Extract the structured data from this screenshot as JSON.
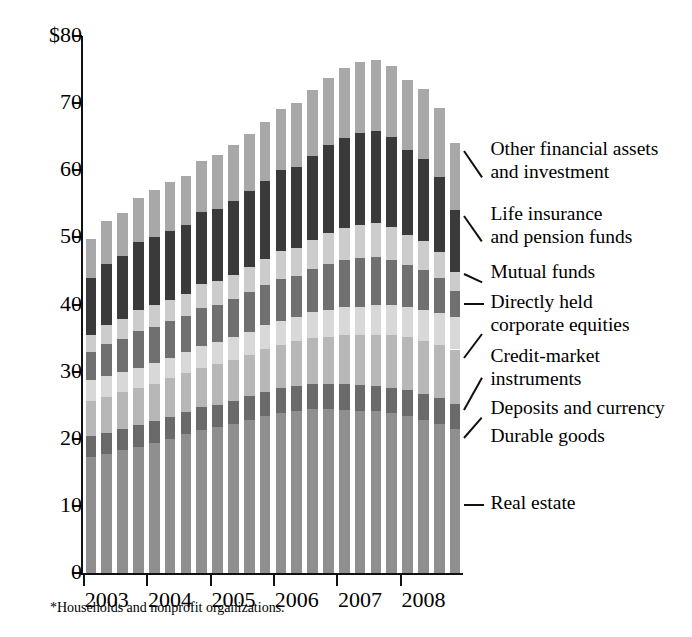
{
  "chart_data": {
    "type": "bar",
    "subtype": "stacked-vertical",
    "title": "",
    "xlabel": "",
    "ylabel": "",
    "ylim": [
      0,
      80
    ],
    "yticks": [
      0,
      10,
      20,
      30,
      40,
      50,
      60,
      70,
      80
    ],
    "ytick_labels": [
      "0",
      "10",
      "20",
      "30",
      "40",
      "50",
      "60",
      "70",
      "$80"
    ],
    "units": "trillions of dollars",
    "grid": false,
    "legend_position": "right-callouts",
    "xticks": [
      2003,
      2004,
      2005,
      2006,
      2007,
      2008
    ],
    "xtick_labels": [
      "2003",
      "2004",
      "2005",
      "2006",
      "2007",
      "2008"
    ],
    "x": [
      "2003Q1",
      "2003Q2",
      "2003Q3",
      "2003Q4",
      "2004Q1",
      "2004Q2",
      "2004Q3",
      "2004Q4",
      "2005Q1",
      "2005Q2",
      "2005Q3",
      "2005Q4",
      "2006Q1",
      "2006Q2",
      "2006Q3",
      "2006Q4",
      "2007Q1",
      "2007Q2",
      "2007Q3",
      "2007Q4",
      "2008Q1",
      "2008Q2",
      "2008Q3",
      "2008Q4"
    ],
    "series": [
      {
        "name": "Real estate",
        "color": "#8f8f8f",
        "values": [
          17.3,
          17.8,
          18.3,
          18.8,
          19.4,
          20.0,
          20.7,
          21.3,
          21.7,
          22.2,
          22.8,
          23.4,
          23.9,
          24.2,
          24.4,
          24.4,
          24.3,
          24.2,
          24.1,
          23.8,
          23.4,
          22.8,
          22.2,
          21.5
        ]
      },
      {
        "name": "Durable goods",
        "color": "#6a6a6a",
        "values": [
          3.1,
          3.1,
          3.2,
          3.2,
          3.2,
          3.3,
          3.3,
          3.4,
          3.4,
          3.5,
          3.5,
          3.6,
          3.6,
          3.6,
          3.7,
          3.7,
          3.8,
          3.8,
          3.8,
          3.8,
          3.8,
          3.8,
          3.8,
          3.7
        ]
      },
      {
        "name": "Deposits and currency",
        "color": "#b7b7b7",
        "values": [
          5.2,
          5.3,
          5.4,
          5.5,
          5.6,
          5.7,
          5.8,
          5.9,
          6.0,
          6.1,
          6.2,
          6.4,
          6.5,
          6.7,
          6.9,
          7.1,
          7.3,
          7.4,
          7.6,
          7.8,
          7.9,
          7.9,
          8.0,
          8.1
        ]
      },
      {
        "name": "Credit-market instruments",
        "color": "#d8d8d8",
        "values": [
          3.1,
          3.1,
          3.1,
          3.1,
          3.1,
          3.1,
          3.2,
          3.2,
          3.3,
          3.3,
          3.4,
          3.5,
          3.6,
          3.7,
          3.9,
          4.0,
          4.2,
          4.3,
          4.4,
          4.5,
          4.6,
          4.7,
          4.8,
          4.9
        ]
      },
      {
        "name": "Directly held corporate equities",
        "color": "#707070",
        "values": [
          4.3,
          4.8,
          4.9,
          5.4,
          5.4,
          5.4,
          5.3,
          5.7,
          5.6,
          5.7,
          5.9,
          6.0,
          6.2,
          6.1,
          6.4,
          6.8,
          7.0,
          7.2,
          7.2,
          6.8,
          6.2,
          5.9,
          5.2,
          3.8
        ]
      },
      {
        "name": "Mutual funds",
        "color": "#cccccc",
        "values": [
          2.5,
          2.8,
          2.9,
          3.2,
          3.2,
          3.2,
          3.2,
          3.5,
          3.5,
          3.6,
          3.8,
          3.9,
          4.1,
          4.1,
          4.3,
          4.6,
          4.8,
          5.0,
          5.0,
          4.9,
          4.5,
          4.3,
          3.8,
          2.9
        ]
      },
      {
        "name": "Life insurance and pension funds",
        "color": "#3a3a3a",
        "values": [
          8.4,
          9.2,
          9.4,
          10.1,
          10.2,
          10.3,
          10.3,
          10.8,
          10.8,
          11.0,
          11.3,
          11.6,
          12.1,
          12.1,
          12.5,
          13.1,
          13.4,
          13.7,
          13.7,
          13.4,
          12.6,
          12.3,
          11.2,
          9.2
        ]
      },
      {
        "name": "Other financial assets and investment",
        "color": "#a8a8a8",
        "values": [
          5.9,
          6.3,
          6.4,
          6.6,
          7.0,
          7.2,
          7.3,
          7.6,
          8.0,
          8.3,
          8.5,
          8.8,
          9.2,
          9.5,
          9.8,
          10.1,
          10.4,
          10.6,
          10.6,
          10.6,
          10.5,
          10.4,
          10.3,
          10.0
        ]
      }
    ],
    "totals": [
      49.8,
      52.4,
      53.6,
      55.9,
      57.1,
      58.2,
      59.1,
      61.4,
      62.3,
      63.7,
      65.4,
      67.2,
      69.2,
      70.0,
      71.9,
      73.8,
      75.2,
      76.2,
      76.4,
      75.6,
      73.5,
      72.1,
      69.3,
      64.1
    ],
    "annotations": [
      "Peak occurs in 2007, totals decline through 2008"
    ]
  },
  "axis": {
    "y_tick_labels": [
      "$80",
      "70",
      "60",
      "50",
      "40",
      "30",
      "20",
      "10",
      "0"
    ],
    "x_tick_labels": [
      "2003",
      "2004",
      "2005",
      "2006",
      "2007",
      "2008"
    ]
  },
  "callouts": [
    {
      "id": "other-financial-assets",
      "line1": "Other financial assets",
      "line2": "and investment"
    },
    {
      "id": "life-insurance",
      "line1": "Life insurance",
      "line2": "and pension funds"
    },
    {
      "id": "mutual-funds",
      "line1": "Mutual funds",
      "line2": ""
    },
    {
      "id": "directly-held-equities",
      "line1": "Directly held",
      "line2": "corporate equities"
    },
    {
      "id": "credit-market",
      "line1": "Credit-market",
      "line2": "instruments"
    },
    {
      "id": "deposits-currency",
      "line1": "Deposits and currency",
      "line2": ""
    },
    {
      "id": "durable-goods",
      "line1": "Durable goods",
      "line2": ""
    },
    {
      "id": "real-estate",
      "line1": "Real estate",
      "line2": ""
    }
  ],
  "footnote": "*Households and nonprofit organizations."
}
